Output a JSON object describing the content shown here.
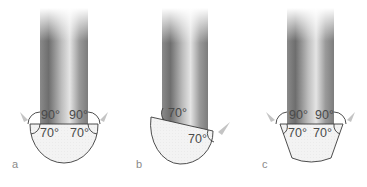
{
  "figure": {
    "panels": [
      {
        "label": "a",
        "shape": "hemispherical-drop",
        "angles": {
          "upper_left": "90°",
          "upper_right": "90°",
          "lower_left": "70°",
          "lower_right": "70°"
        }
      },
      {
        "label": "b",
        "shape": "tilted-cut-drop",
        "angles": {
          "upper_left": "70°",
          "lower_right": "70°"
        }
      },
      {
        "label": "c",
        "shape": "trapezoidal-drop",
        "angles": {
          "upper_left": "90°",
          "upper_right": "90°",
          "lower_left": "70°",
          "lower_right": "70°"
        }
      }
    ],
    "colors": {
      "cylinder_dark": "#7a7a7a",
      "cylinder_light": "#d8d8d8",
      "drop_fill": "#f2f2f2",
      "outline": "#3a3a3a",
      "arrow": "#c4c4c4",
      "text": "#4a4a4a"
    }
  }
}
